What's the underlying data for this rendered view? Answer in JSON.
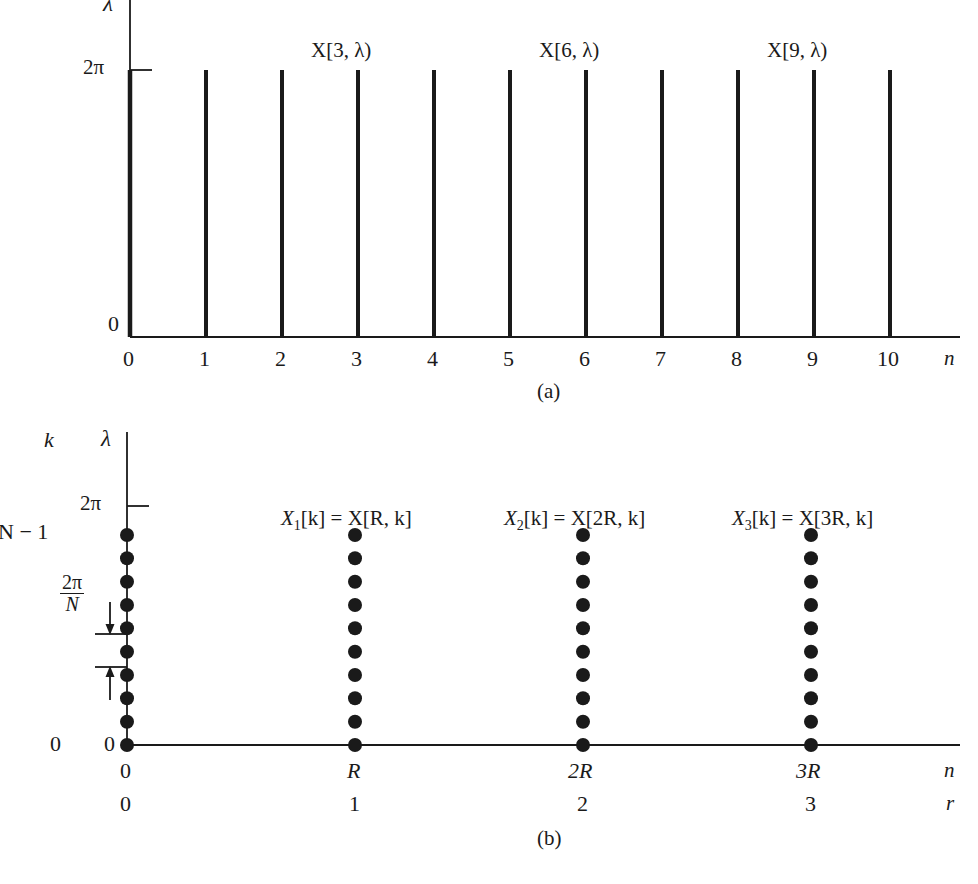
{
  "figure": {
    "panels": [
      {
        "id": "a",
        "caption": "(a)",
        "y_axis_label": "λ",
        "y_tick_label": "2π",
        "y_origin_label": "0",
        "x_axis_label": "n",
        "x_tick_labels": [
          "0",
          "1",
          "2",
          "3",
          "4",
          "5",
          "6",
          "7",
          "8",
          "9",
          "10"
        ],
        "stem_labels": [
          {
            "text": "X[3, λ)",
            "at": 3
          },
          {
            "text": "X[6, λ)",
            "at": 6
          },
          {
            "text": "X[9, λ)",
            "at": 9
          }
        ]
      },
      {
        "id": "b",
        "caption": "(b)",
        "k_axis_label": "k",
        "k_top_label": "N − 1",
        "k_bottom_label": "0",
        "y_axis_label": "λ",
        "y_tick_label": "2π",
        "y_origin_label": "0",
        "spacing_label": {
          "numerator": "2π",
          "denominator": "N"
        },
        "x_axis_label": "n",
        "r_axis_label": "r",
        "x_tick_labels": [
          "0",
          "R",
          "2R",
          "3R"
        ],
        "r_tick_labels": [
          "0",
          "1",
          "2",
          "3"
        ],
        "dots_per_column": 10,
        "column_labels": [
          {
            "base": "X",
            "sub": "1",
            "text": "[k] = X[R, k]",
            "full": "X₁[k] = X[R, k]",
            "at": 1
          },
          {
            "base": "X",
            "sub": "2",
            "text": "[k] = X[2R, k]",
            "full": "X₂[k] = X[2R, k]",
            "at": 2
          },
          {
            "base": "X",
            "sub": "3",
            "text": "[k] = X[3R, k]",
            "full": "X₃[k] = X[3R, k]",
            "at": 3
          }
        ]
      }
    ],
    "colors": {
      "ink": "#1a1a1a",
      "background": "#ffffff"
    }
  }
}
